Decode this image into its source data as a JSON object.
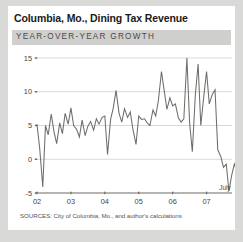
{
  "figure": {
    "title": "Columbia, Mo., Dining Tax Revenue",
    "subtitle": "YEAR-OVER-YEAR GROWTH",
    "source": "SOURCES: City of Columbia, Mo., and author's calculations",
    "background": "#ffffff",
    "page_background": "#d9d9d7",
    "subtitle_band_color": "#cfcfcd"
  },
  "chart_data": {
    "type": "line",
    "title": "Columbia, Mo., Dining Tax Revenue",
    "subtitle": "YEAR-OVER-YEAR GROWTH",
    "xlabel": "",
    "ylabel": "",
    "series_color": "#6e6d68",
    "grid": true,
    "legend": false,
    "ylim": [
      -5,
      15
    ],
    "yticks": [
      -5,
      0,
      5,
      10,
      15
    ],
    "ytick_labels": [
      "-5",
      "0",
      "5",
      "10",
      "15"
    ],
    "xlim": [
      2002.0,
      2007.75
    ],
    "xticks": [
      2002,
      2003,
      2004,
      2005,
      2006,
      2007
    ],
    "xtick_labels": [
      "02",
      "03",
      "04",
      "05",
      "06",
      "07"
    ],
    "annotations": [
      {
        "label": "July",
        "x": 2007.54,
        "y": -4.6
      }
    ],
    "x": [
      2002.0,
      2002.08,
      2002.17,
      2002.25,
      2002.33,
      2002.42,
      2002.5,
      2002.58,
      2002.67,
      2002.75,
      2002.83,
      2002.92,
      2003.0,
      2003.08,
      2003.17,
      2003.25,
      2003.33,
      2003.42,
      2003.5,
      2003.58,
      2003.67,
      2003.75,
      2003.83,
      2003.92,
      2004.0,
      2004.08,
      2004.17,
      2004.25,
      2004.33,
      2004.42,
      2004.5,
      2004.58,
      2004.67,
      2004.75,
      2004.83,
      2004.92,
      2005.0,
      2005.08,
      2005.17,
      2005.25,
      2005.33,
      2005.42,
      2005.5,
      2005.58,
      2005.67,
      2005.75,
      2005.83,
      2005.92,
      2006.0,
      2006.08,
      2006.17,
      2006.25,
      2006.33,
      2006.42,
      2006.5,
      2006.58,
      2006.67,
      2006.75,
      2006.83,
      2006.92,
      2007.0,
      2007.08,
      2007.17,
      2007.25,
      2007.33,
      2007.42,
      2007.5
    ],
    "values": [
      5.2,
      1.6,
      -4.1,
      5.0,
      3.6,
      6.7,
      4.1,
      2.3,
      5.4,
      3.8,
      6.8,
      5.2,
      7.6,
      5.0,
      4.4,
      3.3,
      5.8,
      3.5,
      4.9,
      5.6,
      4.3,
      6.0,
      5.2,
      6.2,
      6.4,
      0.7,
      5.9,
      7.6,
      10.2,
      6.8,
      5.5,
      7.5,
      6.2,
      7.0,
      4.4,
      2.2,
      6.4,
      5.9,
      6.0,
      5.4,
      5.0,
      7.3,
      6.4,
      8.7,
      13.0,
      10.2,
      7.4,
      9.1,
      7.9,
      8.2,
      6.1,
      5.5,
      6.0,
      15.0,
      5.4,
      1.1,
      9.6,
      14.1,
      5.0,
      9.4,
      13.0,
      8.2,
      9.6,
      10.3,
      1.4,
      0.4,
      -1.2
    ],
    "values_tail": [
      -0.7,
      -4.7,
      -2.4,
      -0.7,
      -2.0,
      -2.4
    ]
  }
}
